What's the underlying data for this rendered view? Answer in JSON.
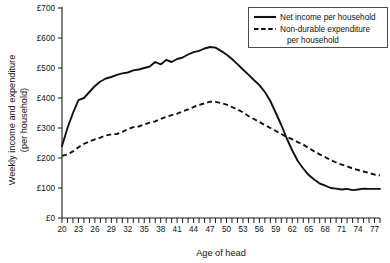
{
  "chart_data": {
    "type": "line",
    "title": "",
    "xlabel": "Age of head",
    "ylabel": "Weekly income and expenditure (per household)",
    "ylabel_line1": "Weekly income and expenditure",
    "ylabel_line2": "(per household)",
    "xlim": [
      20,
      78
    ],
    "ylim": [
      0,
      700
    ],
    "grid": false,
    "legend_position": "top-right",
    "y_ticks": [
      0,
      100,
      200,
      300,
      400,
      500,
      600,
      700
    ],
    "y_tick_labels": [
      "£0",
      "£100",
      "£200",
      "£300",
      "£400",
      "£500",
      "£600",
      "£700"
    ],
    "x_ticks": [
      20,
      21,
      22,
      23,
      24,
      25,
      26,
      27,
      28,
      29,
      30,
      31,
      32,
      33,
      34,
      35,
      36,
      37,
      38,
      39,
      40,
      41,
      42,
      43,
      44,
      45,
      46,
      47,
      48,
      49,
      50,
      51,
      52,
      53,
      54,
      55,
      56,
      57,
      58,
      59,
      60,
      61,
      62,
      63,
      64,
      65,
      66,
      67,
      68,
      69,
      70,
      71,
      72,
      73,
      74,
      75,
      76,
      77,
      78
    ],
    "x_tick_labels_shown": [
      20,
      23,
      26,
      29,
      32,
      35,
      38,
      41,
      44,
      47,
      50,
      53,
      56,
      59,
      62,
      65,
      68,
      71,
      74,
      77
    ],
    "x": [
      20,
      21,
      22,
      23,
      24,
      25,
      26,
      27,
      28,
      29,
      30,
      31,
      32,
      33,
      34,
      35,
      36,
      37,
      38,
      39,
      40,
      41,
      42,
      43,
      44,
      45,
      46,
      47,
      48,
      49,
      50,
      51,
      52,
      53,
      54,
      55,
      56,
      57,
      58,
      59,
      60,
      61,
      62,
      63,
      64,
      65,
      66,
      67,
      68,
      69,
      70,
      71,
      72,
      73,
      74,
      75,
      76,
      77,
      78
    ],
    "series": [
      {
        "name": "Net income per household",
        "style": "solid",
        "color": "#111111",
        "values": [
          240,
          300,
          350,
          393,
          400,
          420,
          440,
          455,
          465,
          470,
          477,
          482,
          485,
          492,
          495,
          500,
          505,
          520,
          512,
          527,
          520,
          530,
          535,
          545,
          553,
          557,
          565,
          570,
          568,
          557,
          545,
          530,
          513,
          495,
          478,
          460,
          443,
          420,
          390,
          350,
          310,
          265,
          225,
          190,
          165,
          143,
          128,
          115,
          108,
          100,
          98,
          95,
          97,
          93,
          95,
          98,
          97,
          97,
          97
        ]
      },
      {
        "name": "Non-durable expenditure per household",
        "style": "dashed",
        "color": "#111111",
        "values": [
          207,
          212,
          222,
          236,
          247,
          255,
          262,
          268,
          275,
          279,
          280,
          287,
          296,
          303,
          305,
          312,
          318,
          322,
          330,
          337,
          343,
          348,
          355,
          362,
          370,
          377,
          382,
          388,
          387,
          383,
          378,
          370,
          362,
          352,
          340,
          330,
          320,
          310,
          300,
          290,
          280,
          270,
          262,
          253,
          245,
          233,
          222,
          212,
          203,
          193,
          185,
          178,
          172,
          165,
          160,
          155,
          150,
          145,
          142
        ]
      }
    ],
    "legend": [
      {
        "label": "Net income per household",
        "style": "solid"
      },
      {
        "label": "Non-durable expenditure",
        "label_line2": "per household",
        "style": "dashed"
      }
    ]
  }
}
